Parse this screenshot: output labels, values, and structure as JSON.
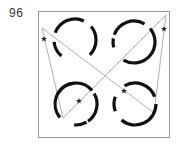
{
  "figure": {
    "number_label": "96",
    "frame": {
      "x": 38,
      "y": 11,
      "width": 131,
      "height": 126,
      "stroke": "#9a9a9a"
    },
    "colors": {
      "arc": "#111111",
      "line": "#9e9e9e",
      "star": "#222222"
    },
    "circles": [
      {
        "name": "top-left",
        "cx": 75,
        "cy": 40,
        "r": 21,
        "arcs": [
          [
            200,
            295
          ],
          [
            320,
            405
          ],
          [
            130,
            175
          ]
        ]
      },
      {
        "name": "top-right",
        "cx": 134,
        "cy": 42,
        "r": 21,
        "arcs": [
          [
            200,
            300
          ],
          [
            165,
            190
          ],
          [
            -40,
            120
          ]
        ]
      },
      {
        "name": "bottom-left",
        "cx": 76,
        "cy": 104,
        "r": 21,
        "arcs": [
          [
            210,
            320
          ],
          [
            140,
            260
          ],
          [
            -30,
            55
          ],
          [
            60,
            95
          ]
        ]
      },
      {
        "name": "bottom-right",
        "cx": 135,
        "cy": 104,
        "r": 21,
        "arcs": [
          [
            240,
            340
          ],
          [
            160,
            200
          ],
          [
            0,
            130
          ]
        ]
      }
    ],
    "lines": [
      {
        "name": "diagonal-a",
        "points": [
          [
            42,
            28
          ],
          [
            154,
            113
          ]
        ]
      },
      {
        "name": "diagonal-b",
        "points": [
          [
            63,
            118
          ],
          [
            166,
            15
          ]
        ]
      },
      {
        "name": "left-triangle-side",
        "points": [
          [
            42,
            28
          ],
          [
            63,
            118
          ]
        ]
      },
      {
        "name": "right-triangle-side",
        "points": [
          [
            166,
            15
          ],
          [
            154,
            113
          ]
        ]
      }
    ],
    "stars": [
      {
        "name": "star-top-left",
        "x": 44,
        "y": 39
      },
      {
        "name": "star-top-right",
        "x": 164,
        "y": 29
      },
      {
        "name": "star-bottom-left",
        "x": 79,
        "y": 101
      },
      {
        "name": "star-bottom-right",
        "x": 124,
        "y": 91
      }
    ]
  }
}
